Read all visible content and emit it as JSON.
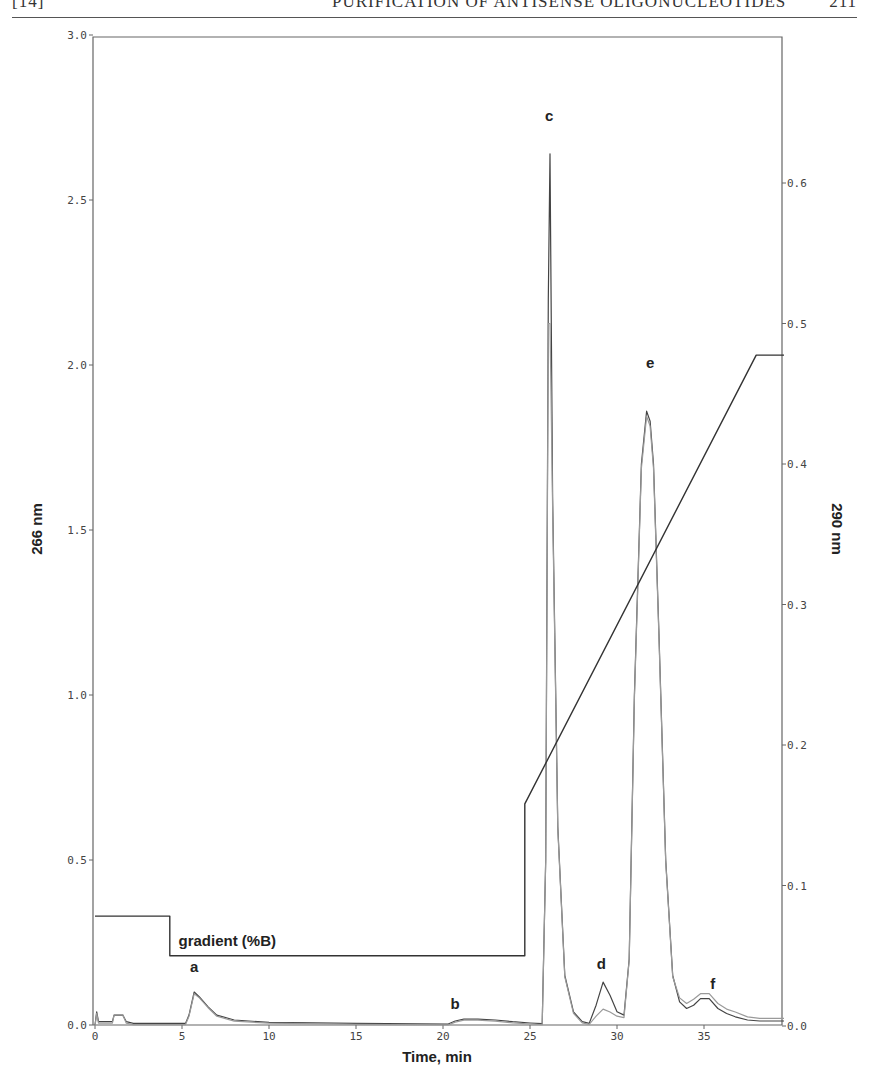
{
  "header": {
    "section": "[14]",
    "title": "PURIFICATION OF ANTISENSE OLIGONUCLEOTIDES",
    "page": "211"
  },
  "chart_data": {
    "type": "line",
    "title": "",
    "xlabel": "Time, min",
    "ylabel_left": "266 nm",
    "ylabel_right": "290 nm",
    "xlim": [
      0,
      39.6
    ],
    "ylim_left": [
      0,
      3.0
    ],
    "ylim_right": [
      0,
      0.7
    ],
    "x_ticks": [
      0,
      5,
      10,
      15,
      20,
      25,
      30,
      35
    ],
    "y_ticks_left": [
      0.0,
      0.5,
      1.0,
      1.5,
      2.0,
      2.5,
      3.0
    ],
    "y_ticks_left_labels": [
      "0.0",
      "0.5",
      "1.0",
      "1.5",
      "2.0",
      "2.5",
      "3.0"
    ],
    "y_ticks_right": [
      0.0,
      0.1,
      0.2,
      0.3,
      0.4,
      0.5,
      0.6
    ],
    "y_ticks_right_labels": [
      "0.0",
      "0.1",
      "0.2",
      "0.3",
      "0.4",
      "0.5",
      "0.6"
    ],
    "grid": false,
    "legend": null,
    "annotations": [
      {
        "label": "a",
        "x": 5.7,
        "y": 0.16
      },
      {
        "label": "b",
        "x": 20.7,
        "y": 0.05
      },
      {
        "label": "c",
        "x": 26.1,
        "y": 2.74
      },
      {
        "label": "d",
        "x": 29.1,
        "y": 0.17
      },
      {
        "label": "e",
        "x": 31.9,
        "y": 1.99
      },
      {
        "label": "f",
        "x": 35.5,
        "y": 0.11
      },
      {
        "label": "gradient (%B)",
        "x": 4.8,
        "y": 0.24
      }
    ],
    "series": [
      {
        "name": "266 nm",
        "axis": "left",
        "color": "#444444",
        "x": [
          0,
          0.1,
          0.2,
          1.0,
          1.1,
          1.6,
          1.8,
          2.2,
          5.2,
          5.4,
          5.7,
          6.0,
          6.5,
          7.0,
          8.0,
          10,
          15,
          20.3,
          20.7,
          21.2,
          22.0,
          23.0,
          24.0,
          25.0,
          25.7,
          25.9,
          26.05,
          26.15,
          26.3,
          26.6,
          27.0,
          27.5,
          28.0,
          28.4,
          28.8,
          29.2,
          29.6,
          30.0,
          30.4,
          30.7,
          31.0,
          31.4,
          31.7,
          31.9,
          32.1,
          32.4,
          32.8,
          33.2,
          33.6,
          34.0,
          34.4,
          34.8,
          35.3,
          35.8,
          36.3,
          36.8,
          37.5,
          38.2,
          39.0,
          39.6
        ],
        "y": [
          0.0,
          0.04,
          0.01,
          0.01,
          0.03,
          0.03,
          0.01,
          0.005,
          0.005,
          0.03,
          0.1,
          0.085,
          0.055,
          0.03,
          0.015,
          0.008,
          0.005,
          0.003,
          0.012,
          0.018,
          0.018,
          0.015,
          0.01,
          0.006,
          0.004,
          0.5,
          2.2,
          2.64,
          1.6,
          0.6,
          0.15,
          0.04,
          0.01,
          0.005,
          0.06,
          0.13,
          0.09,
          0.04,
          0.03,
          0.2,
          1.0,
          1.7,
          1.86,
          1.83,
          1.7,
          1.2,
          0.5,
          0.15,
          0.07,
          0.05,
          0.06,
          0.08,
          0.08,
          0.05,
          0.035,
          0.025,
          0.015,
          0.012,
          0.012,
          0.012
        ]
      },
      {
        "name": "290 nm",
        "axis": "right",
        "color": "#9a9a9a",
        "x": [
          0,
          0.1,
          0.2,
          1.0,
          1.1,
          1.6,
          1.8,
          2.2,
          5.2,
          5.4,
          5.7,
          6.0,
          6.5,
          7.0,
          8.0,
          10,
          15,
          20.3,
          20.7,
          21.2,
          22.0,
          23.0,
          24.0,
          25.0,
          25.7,
          25.9,
          26.05,
          26.15,
          26.3,
          26.6,
          27.0,
          27.5,
          28.0,
          28.4,
          28.8,
          29.2,
          29.6,
          30.0,
          30.4,
          30.7,
          31.0,
          31.4,
          31.7,
          31.9,
          32.1,
          32.4,
          32.8,
          33.2,
          33.6,
          34.0,
          34.4,
          34.8,
          35.3,
          35.8,
          36.3,
          36.8,
          37.5,
          38.2,
          39.0,
          39.6
        ],
        "y": [
          0.0,
          0.009,
          0.002,
          0.002,
          0.008,
          0.008,
          0.002,
          0.001,
          0.001,
          0.007,
          0.023,
          0.02,
          0.013,
          0.007,
          0.0035,
          0.002,
          0.0012,
          0.0007,
          0.0028,
          0.0042,
          0.0042,
          0.0035,
          0.0023,
          0.0014,
          0.0009,
          0.117,
          0.5,
          0.5,
          0.37,
          0.14,
          0.035,
          0.009,
          0.0023,
          0.0012,
          0.007,
          0.012,
          0.01,
          0.007,
          0.006,
          0.047,
          0.233,
          0.397,
          0.434,
          0.427,
          0.397,
          0.28,
          0.117,
          0.035,
          0.02,
          0.016,
          0.019,
          0.023,
          0.023,
          0.016,
          0.012,
          0.01,
          0.0065,
          0.0055,
          0.0055,
          0.0055
        ]
      },
      {
        "name": "gradient (%B)",
        "axis": "left",
        "color": "#333333",
        "x": [
          0,
          4.3,
          4.3,
          24.7,
          24.7,
          38.0,
          39.6
        ],
        "y": [
          0.33,
          0.33,
          0.21,
          0.21,
          0.67,
          2.03,
          2.03
        ]
      }
    ]
  }
}
